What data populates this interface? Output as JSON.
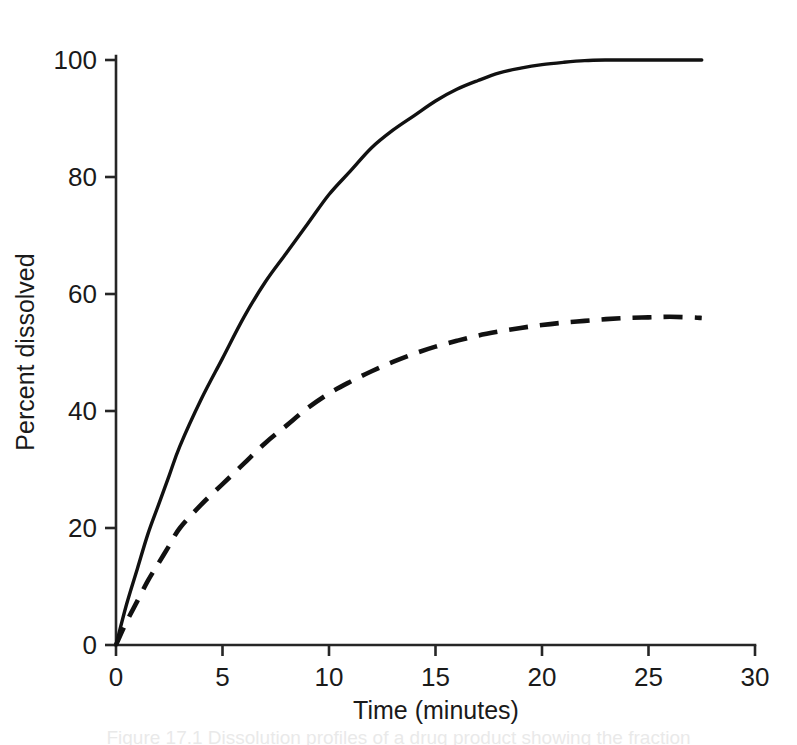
{
  "figure": {
    "name": "dissolution-profile-figure",
    "background": "#ffffff",
    "ink_color": "#111111",
    "caption_partial": "Figure 17.1  Dissolution profiles of a drug product showing the fraction"
  },
  "chart_data": {
    "type": "line",
    "title": "",
    "xlabel": "Time (minutes)",
    "ylabel": "Percent dissolved",
    "xlim": [
      0,
      30
    ],
    "ylim": [
      0,
      100
    ],
    "xticks": [
      0,
      5,
      10,
      15,
      20,
      25,
      30
    ],
    "xtick_labels": [
      "0",
      "5",
      "10",
      "15",
      "20",
      "25",
      "30"
    ],
    "yticks": [
      0,
      20,
      40,
      60,
      80,
      100
    ],
    "ytick_labels": [
      "0",
      "20",
      "40",
      "60",
      "80",
      "100"
    ],
    "grid": false,
    "legend": null,
    "legend_position": "none",
    "series": [
      {
        "name": "solid-curve",
        "style": "solid",
        "color": "#111111",
        "x": [
          0,
          0.5,
          1,
          1.5,
          2,
          2.5,
          3,
          4,
          5,
          6,
          7,
          8,
          9,
          10,
          11,
          12,
          13,
          14,
          15,
          16,
          17,
          18,
          19,
          20,
          21,
          22,
          23,
          24,
          25,
          26,
          27,
          27.5
        ],
        "values": [
          0,
          7,
          13,
          19,
          24,
          29,
          34,
          42,
          49,
          56,
          62,
          67,
          72,
          77,
          81,
          85,
          88,
          90.5,
          93,
          95,
          96.5,
          97.8,
          98.6,
          99.2,
          99.6,
          99.9,
          100,
          100,
          100,
          100,
          100,
          100
        ]
      },
      {
        "name": "dashed-curve",
        "style": "dashed",
        "color": "#111111",
        "x": [
          0,
          0.5,
          1,
          1.5,
          2,
          2.5,
          3,
          4,
          5,
          6,
          7,
          8,
          9,
          10,
          11,
          12,
          13,
          14,
          15,
          16,
          17,
          18,
          19,
          20,
          21,
          22,
          23,
          24,
          25,
          26,
          27,
          27.5
        ],
        "values": [
          0,
          4,
          7.5,
          11,
          14,
          17,
          20,
          24,
          27.5,
          31,
          34.5,
          37.5,
          40.5,
          43,
          45,
          46.8,
          48.4,
          49.8,
          51,
          52,
          52.9,
          53.6,
          54.2,
          54.7,
          55.1,
          55.4,
          55.7,
          55.9,
          56,
          56.1,
          56,
          55.9
        ]
      }
    ]
  }
}
